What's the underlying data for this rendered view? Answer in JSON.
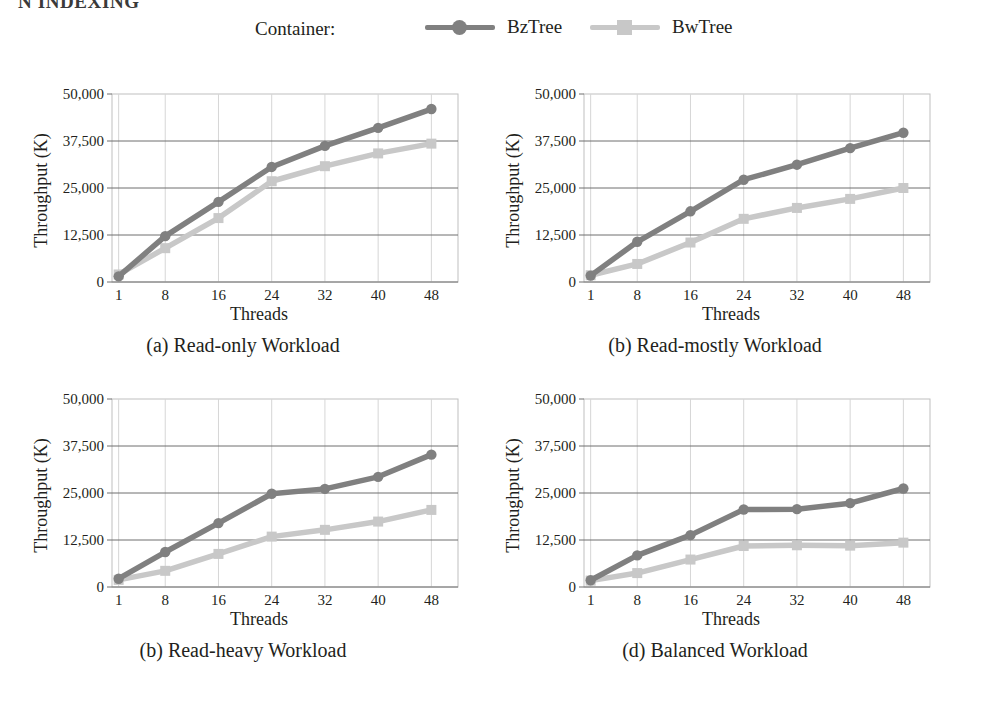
{
  "clipped_header": "N INDEXING",
  "legend": {
    "title": "Container:",
    "entries": [
      {
        "label": "BzTree",
        "color": "#808080",
        "marker": "circle"
      },
      {
        "label": "BwTree",
        "color": "#c8c8c8",
        "marker": "square"
      }
    ]
  },
  "axis": {
    "ylabel": "Throughput (K)",
    "xlabel": "Threads",
    "ytick_labels": [
      "0",
      "12,500",
      "25,000",
      "37,500",
      "50,000"
    ],
    "ytick_values": [
      0,
      12500,
      25000,
      37500,
      50000
    ],
    "xtick_labels": [
      "1",
      "8",
      "16",
      "24",
      "32",
      "40",
      "48"
    ]
  },
  "colors": {
    "bztree": "#808080",
    "bwtree": "#c8c8c8",
    "gridline": "#6f6f6f",
    "frame": "#bfbfbf",
    "text": "#231f20"
  },
  "chart_data": [
    {
      "type": "line",
      "panel": "a",
      "title": "(a) Read-only Workload",
      "xlabel": "Threads",
      "ylabel": "Throughput (K)",
      "x": [
        1,
        8,
        16,
        24,
        32,
        40,
        48
      ],
      "xlim": [
        0,
        52
      ],
      "ylim": [
        0,
        50000
      ],
      "grid": true,
      "legend_position": "top",
      "series": [
        {
          "name": "BzTree",
          "values": [
            1500,
            12200,
            21300,
            30600,
            36200,
            41000,
            46000
          ]
        },
        {
          "name": "BwTree",
          "values": [
            2000,
            9000,
            17000,
            26800,
            30800,
            34200,
            36800
          ]
        }
      ]
    },
    {
      "type": "line",
      "panel": "b",
      "title": "(b) Read-mostly Workload",
      "xlabel": "Threads",
      "ylabel": "Throughput (K)",
      "x": [
        1,
        8,
        16,
        24,
        32,
        40,
        48
      ],
      "xlim": [
        0,
        52
      ],
      "ylim": [
        0,
        50000
      ],
      "grid": true,
      "legend_position": "top",
      "series": [
        {
          "name": "BzTree",
          "values": [
            1700,
            10700,
            18800,
            27200,
            31200,
            35600,
            39700
          ]
        },
        {
          "name": "BwTree",
          "values": [
            1800,
            4800,
            10500,
            16800,
            19700,
            22100,
            25000
          ]
        }
      ]
    },
    {
      "type": "line",
      "panel": "c",
      "title": "(b) Read-heavy Workload",
      "xlabel": "Threads",
      "ylabel": "Throughput (K)",
      "x": [
        1,
        8,
        16,
        24,
        32,
        40,
        48
      ],
      "xlim": [
        0,
        52
      ],
      "ylim": [
        0,
        50000
      ],
      "grid": true,
      "legend_position": "top",
      "series": [
        {
          "name": "BzTree",
          "values": [
            2200,
            9300,
            17000,
            24800,
            26100,
            29300,
            35200
          ]
        },
        {
          "name": "BwTree",
          "values": [
            1900,
            4300,
            8800,
            13400,
            15200,
            17400,
            20500
          ]
        }
      ]
    },
    {
      "type": "line",
      "panel": "d",
      "title": "(d) Balanced Workload",
      "xlabel": "Threads",
      "ylabel": "Throughput (K)",
      "x": [
        1,
        8,
        16,
        24,
        32,
        40,
        48
      ],
      "xlim": [
        0,
        52
      ],
      "ylim": [
        0,
        50000
      ],
      "grid": true,
      "legend_position": "top",
      "series": [
        {
          "name": "BzTree",
          "values": [
            1800,
            8400,
            13800,
            20600,
            20700,
            22300,
            26200
          ]
        },
        {
          "name": "BwTree",
          "values": [
            1700,
            3700,
            7300,
            10900,
            11100,
            11000,
            11800
          ]
        }
      ]
    }
  ]
}
